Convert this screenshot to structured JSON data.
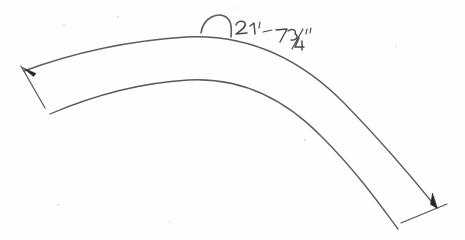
{
  "document": {
    "kind": "hand-drawn-sketch",
    "subject": "curved band arc segment with arc length dimension",
    "background_color": "#fefefe",
    "ink_color": "#5a5a5c",
    "width": 465,
    "height": 240
  },
  "dimension": {
    "label": "21'-7 3/4\"",
    "feet": "21",
    "feet_mark": "'",
    "separator": "-",
    "inches_whole": "7",
    "fraction_numerator": "3",
    "fraction_denominator": "4",
    "inch_mark": "\"",
    "symbol_name": "arc-length-symbol",
    "symbol_glyph": "⌢",
    "measurement_type": "arc length",
    "text_color": "#47474c"
  },
  "geometry": {
    "outer_arc": {
      "name": "outer-arc-edge",
      "start": [
        24,
        71
      ],
      "apex": [
        186,
        37
      ],
      "end": [
        436,
        207
      ],
      "path": "M 24 71 C 70 54, 124 41, 186 37 C 248 34, 300 58, 345 104 C 385 145, 415 181, 436 207"
    },
    "inner_arc": {
      "name": "inner-arc-edge",
      "start": [
        50,
        114
      ],
      "apex": [
        188,
        80
      ],
      "end": [
        398,
        229
      ],
      "path": "M 50 114 C 92 96, 138 83, 188 80 C 240 77, 284 98, 322 137 C 357 172, 381 206, 398 229"
    },
    "left_witness": {
      "name": "left-extension-line",
      "start": [
        21,
        66
      ],
      "end": [
        45,
        108
      ]
    },
    "right_witness": {
      "name": "right-extension-line",
      "start": [
        401,
        223
      ],
      "end": [
        447,
        204
      ]
    },
    "left_arrow": {
      "name": "left-dimension-arrowhead",
      "tip": [
        23,
        68
      ],
      "angle_deg": 60
    },
    "right_arrow": {
      "name": "right-dimension-arrowhead",
      "tip": [
        436,
        208
      ],
      "angle_deg": 62
    }
  }
}
